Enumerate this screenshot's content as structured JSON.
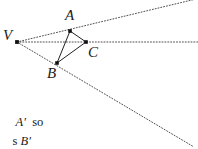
{
  "figure": {
    "title_text": "",
    "background_color": "#ffffff",
    "stroke_color": "#333333",
    "dot_color": "#111111",
    "points": [
      {
        "id": "V",
        "label": "V",
        "x": 17,
        "y": 42,
        "label_x": 3,
        "label_y": 28
      },
      {
        "id": "A",
        "label": "A",
        "x": 70,
        "y": 31,
        "label_x": 65,
        "label_y": 8
      },
      {
        "id": "C",
        "label": "C",
        "x": 86,
        "y": 42,
        "label_x": 88,
        "label_y": 45
      },
      {
        "id": "B",
        "label": "B",
        "x": 57,
        "y": 63,
        "label_x": 47,
        "label_y": 66
      }
    ],
    "solid_edges": [
      {
        "name": "edge-A-B",
        "from": "A",
        "to": "B"
      },
      {
        "name": "edge-A-C",
        "from": "A",
        "to": "C"
      },
      {
        "name": "edge-B-C",
        "from": "B",
        "to": "C"
      }
    ],
    "dotted_rays": [
      {
        "name": "ray-V-through-A",
        "x1": 17,
        "y1": 42,
        "x2": 196,
        "y2": -1
      },
      {
        "name": "ray-V-through-C",
        "x1": 17,
        "y1": 42,
        "x2": 198,
        "y2": 42
      },
      {
        "name": "ray-V-through-B",
        "x1": 17,
        "y1": 42,
        "x2": 194,
        "y2": 147
      }
    ]
  },
  "caption": {
    "line1_italic_1": "A′",
    "line1_roman_1": "  so",
    "line2_roman_1": "s ",
    "line2_italic_1": "B′"
  }
}
